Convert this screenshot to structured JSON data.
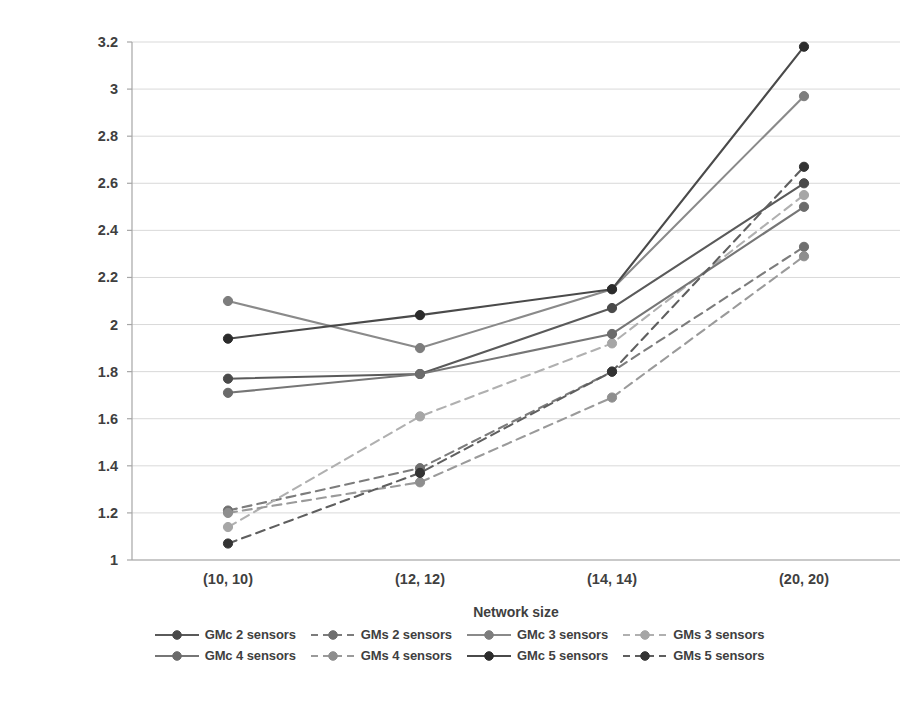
{
  "chart_data": {
    "type": "line",
    "title": "",
    "xlabel": "Network size",
    "ylabel": "",
    "categories": [
      "(10, 10)",
      "(12, 12)",
      "(14, 14)",
      "(20, 20)"
    ],
    "ylim": [
      1,
      3.2
    ],
    "ytick_labels": [
      "1",
      "1.2",
      "1.4",
      "1.6",
      "1.8",
      "2",
      "2.2",
      "2.4",
      "2.6",
      "2.8",
      "3",
      "3.2"
    ],
    "ytick_values": [
      1,
      1.2,
      1.4,
      1.6,
      1.8,
      2,
      2.2,
      2.4,
      2.6,
      2.8,
      3,
      3.2
    ],
    "grid": true,
    "legend_position": "bottom",
    "series": [
      {
        "name": "GMc 2 sensors",
        "style": "solid",
        "color": "#5a5a5a",
        "marker_color": "#4a4a4a",
        "values": [
          1.77,
          1.79,
          2.07,
          2.6
        ]
      },
      {
        "name": "GMs 2 sensors",
        "style": "dashed",
        "color": "#7c7c7c",
        "marker_color": "#6f6f6f",
        "values": [
          1.21,
          1.39,
          1.8,
          2.33
        ]
      },
      {
        "name": "GMc 3 sensors",
        "style": "solid",
        "color": "#8a8a8a",
        "marker_color": "#7d7d7d",
        "values": [
          2.1,
          1.9,
          2.15,
          2.97
        ]
      },
      {
        "name": "GMs 3 sensors",
        "style": "dashed",
        "color": "#b0b0b0",
        "marker_color": "#a6a6a6",
        "values": [
          1.14,
          1.61,
          1.92,
          2.55
        ]
      },
      {
        "name": "GMc 4 sensors",
        "style": "solid",
        "color": "#767676",
        "marker_color": "#6b6b6b",
        "values": [
          1.71,
          1.79,
          1.96,
          2.5
        ]
      },
      {
        "name": "GMs 4 sensors",
        "style": "dashed",
        "color": "#9a9a9a",
        "marker_color": "#8e8e8e",
        "values": [
          1.2,
          1.33,
          1.69,
          2.29
        ]
      },
      {
        "name": "GMc 5 sensors",
        "style": "solid",
        "color": "#4a4a4a",
        "marker_color": "#2b2b2b",
        "values": [
          1.94,
          2.04,
          2.15,
          3.18
        ]
      },
      {
        "name": "GMs 5 sensors",
        "style": "dashed",
        "color": "#5f5f5f",
        "marker_color": "#333333",
        "values": [
          1.07,
          1.37,
          1.8,
          2.67
        ]
      }
    ]
  },
  "axes": {
    "x_title": "Network size"
  },
  "legend": {
    "rows": [
      [
        "GMc 2 sensors",
        "GMs 2 sensors",
        "GMc 3 sensors",
        "GMs 3 sensors"
      ],
      [
        "GMc 4 sensors",
        "GMs 4 sensors",
        "GMc 5 sensors",
        "GMs 5 sensors"
      ]
    ]
  },
  "colors": {
    "grid": "#d9d9d9",
    "axis": "#a6a6a6",
    "text": "#3f3f3f"
  }
}
